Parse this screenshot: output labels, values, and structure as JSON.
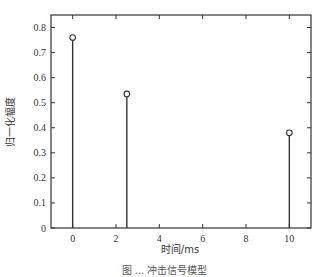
{
  "chart_data": {
    "type": "stem",
    "title": "",
    "xlabel": "时间/ms",
    "ylabel": "归一化幅度",
    "x": [
      0,
      2.5,
      10
    ],
    "values": [
      0.76,
      0.535,
      0.38
    ],
    "xlim": [
      -1,
      11
    ],
    "ylim": [
      0,
      0.85
    ],
    "xticks": [
      0,
      2,
      4,
      6,
      8,
      10
    ],
    "yticks": [
      0,
      0.1,
      0.2,
      0.3,
      0.4,
      0.5,
      0.6,
      0.7,
      0.8
    ],
    "xtick_labels": [
      "0",
      "2",
      "4",
      "6",
      "8",
      "10"
    ],
    "ytick_labels": [
      "0",
      "0.1",
      "0.2",
      "0.3",
      "0.4",
      "0.5",
      "0.6",
      "0.7",
      "0.8"
    ],
    "marker": "circle",
    "grid": false,
    "legend": null
  },
  "caption": "图 ... 冲击信号模型",
  "colors": {
    "line": "#333333",
    "axis": "#333333"
  }
}
